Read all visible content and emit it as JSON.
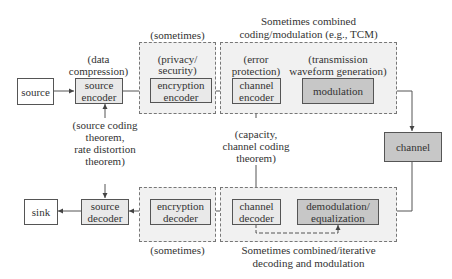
{
  "diagram": {
    "type": "communication-system-block-diagram",
    "transmit_chain": {
      "source": "source",
      "source_encoder": {
        "label": "source encoder",
        "line1": "source",
        "line2": "encoder",
        "annotation_line1": "(data",
        "annotation_line2": "compression)"
      },
      "encryption_encoder": {
        "label": "encryption encoder",
        "line1": "encryption",
        "line2": "encoder",
        "annotation_line1": "(privacy/",
        "annotation_line2": "security)",
        "group_caption": "(sometimes)"
      },
      "channel_encoder": {
        "label": "channel encoder",
        "line1": "channel",
        "line2": "encoder",
        "annotation_line1": "(error",
        "annotation_line2": "protection)"
      },
      "modulation": {
        "label": "modulation",
        "annotation_line1": "(transmission",
        "annotation_line2": "waveform generation)"
      },
      "combined_group_caption_line1": "Sometimes combined",
      "combined_group_caption_line2": "coding/modulation (e.g., TCM)"
    },
    "channel": "channel",
    "receive_chain": {
      "demodulation": {
        "label": "demodulation/ equalization",
        "line1": "demodulation/",
        "line2": "equalization"
      },
      "channel_decoder": {
        "label": "channel decoder",
        "line1": "channel",
        "line2": "decoder"
      },
      "encryption_decoder": {
        "label": "encryption decoder",
        "line1": "encryption",
        "line2": "decoder",
        "group_caption": "(sometimes)"
      },
      "source_decoder": {
        "label": "source decoder",
        "line1": "source",
        "line2": "decoder"
      },
      "sink": "sink",
      "combined_group_caption_line1": "Sometimes combined/iterative",
      "combined_group_caption_line2": "decoding and modulation"
    },
    "theory_annotations": {
      "source": {
        "line1": "(source coding",
        "line2": "theorem,",
        "line3": "rate distortion",
        "line4": "theorem)"
      },
      "channel": {
        "line1": "(capacity,",
        "line2": "channel coding",
        "line3": "theorem)"
      }
    },
    "colors": {
      "white_box": "#ffffff",
      "light_box": "#e9e9e9",
      "dark_box": "#c7c7c7",
      "group_fill": "#f1f1f1",
      "line": "#555555"
    }
  }
}
